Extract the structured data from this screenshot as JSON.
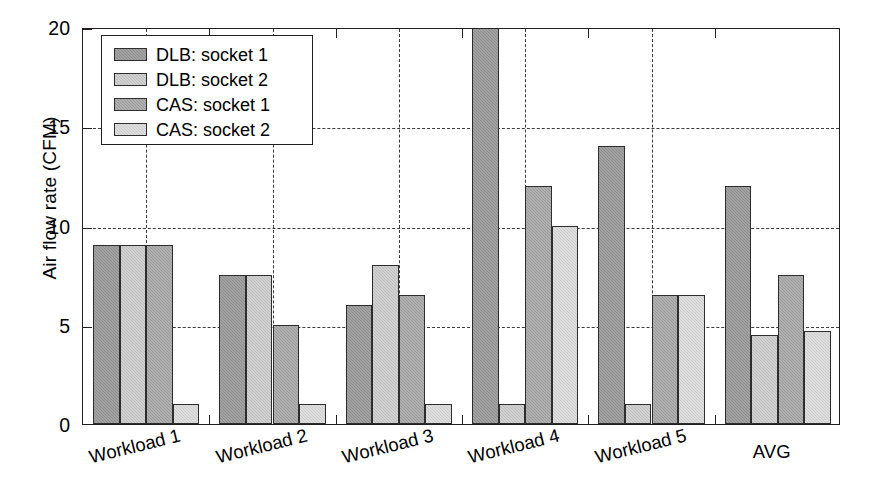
{
  "chart_data": {
    "type": "bar",
    "title": "",
    "xlabel": "",
    "ylabel": "Air flow rate (CFM)",
    "ylim": [
      0,
      20
    ],
    "yticks": [
      0,
      5,
      10,
      15,
      20
    ],
    "ytick_labels": [
      "0",
      "5",
      "10",
      "15",
      "20"
    ],
    "grid": "dashed horizontal and vertical gridlines",
    "legend_position": "upper left, inside axes",
    "categories": [
      "Workload 1",
      "Workload 2",
      "Workload 3",
      "Workload 4",
      "Workload 5",
      "AVG"
    ],
    "series": [
      {
        "name": "DLB: socket 1",
        "color": "#8d8d8d",
        "values": [
          9.0,
          7.5,
          6.0,
          20.5,
          14.0,
          12.0
        ]
      },
      {
        "name": "DLB: socket 2",
        "color": "#bdbdbd",
        "values": [
          9.0,
          7.5,
          8.0,
          1.0,
          1.0,
          4.5
        ]
      },
      {
        "name": "CAS: socket 1",
        "color": "#9a9a9a",
        "values": [
          9.0,
          5.0,
          6.5,
          12.0,
          6.5,
          7.5
        ]
      },
      {
        "name": "CAS: socket 2",
        "color": "#cccccc",
        "values": [
          1.0,
          1.0,
          1.0,
          10.0,
          6.5,
          4.7
        ]
      }
    ]
  },
  "legend": {
    "items": [
      {
        "label": "DLB: socket 1"
      },
      {
        "label": "DLB: socket 2"
      },
      {
        "label": "CAS: socket 1"
      },
      {
        "label": "CAS: socket 2"
      }
    ]
  },
  "axes": {
    "y_title": "Air flow rate (CFM)",
    "y_ticks": [
      "20",
      "15",
      "10",
      "5",
      "0"
    ],
    "x_ticks": [
      "Workload 1",
      "Workload 2",
      "Workload 3",
      "Workload 4",
      "Workload 5",
      "AVG"
    ]
  }
}
